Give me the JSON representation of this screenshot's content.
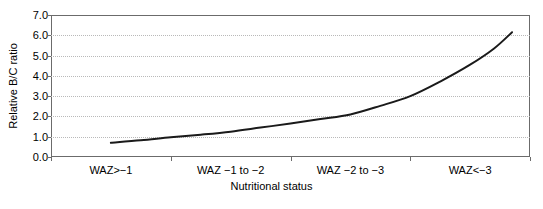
{
  "chart_data": {
    "type": "line",
    "title": "",
    "xlabel": "Nutritional status",
    "ylabel": "Relative B/C ratio",
    "categories": [
      "WAZ>−1",
      "WAZ −1 to −2",
      "WAZ −2 to −3",
      "WAZ<−3"
    ],
    "x": [
      1,
      2,
      3,
      4
    ],
    "values": [
      0.7,
      1.25,
      2.1,
      4.55
    ],
    "series": [
      {
        "name": "Relative B/C ratio",
        "values": [
          0.7,
          1.25,
          2.1,
          4.55
        ],
        "color": "#1a1a1a"
      }
    ],
    "curve_points": [
      {
        "x": 1.0,
        "y": 0.7
      },
      {
        "x": 1.25,
        "y": 0.82
      },
      {
        "x": 1.5,
        "y": 0.97
      },
      {
        "x": 1.75,
        "y": 1.1
      },
      {
        "x": 2.0,
        "y": 1.25
      },
      {
        "x": 2.25,
        "y": 1.45
      },
      {
        "x": 2.5,
        "y": 1.65
      },
      {
        "x": 2.75,
        "y": 1.87
      },
      {
        "x": 3.0,
        "y": 2.1
      },
      {
        "x": 3.25,
        "y": 2.52
      },
      {
        "x": 3.5,
        "y": 3.0
      },
      {
        "x": 3.75,
        "y": 3.72
      },
      {
        "x": 4.0,
        "y": 4.55
      },
      {
        "x": 4.2,
        "y": 5.35
      },
      {
        "x": 4.35,
        "y": 6.15
      }
    ],
    "ylim": [
      0.0,
      7.0
    ],
    "xlim": [
      0.5,
      4.5
    ],
    "ytick_labels": [
      "0.0",
      "1.0",
      "2.0",
      "3.0",
      "4.0",
      "5.0",
      "6.0",
      "7.0"
    ],
    "ytick_values": [
      0.0,
      1.0,
      2.0,
      3.0,
      4.0,
      5.0,
      6.0,
      7.0
    ],
    "grid": true,
    "grid_axis": "y",
    "grid_color": "#b9b9b9",
    "legend": false,
    "legend_position": "none",
    "axis_color": "#6b6b6b",
    "line_color": "#1a1a1a",
    "line_width": 2,
    "background": "#ffffff"
  },
  "caption": {
    "partial_text": ""
  }
}
